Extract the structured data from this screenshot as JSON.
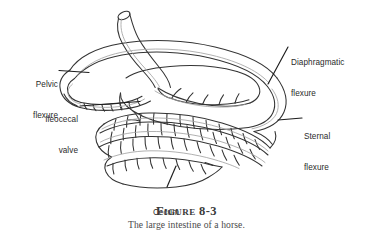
{
  "figure": {
    "number_label": "Figure 8-3",
    "caption": "The large intestine of a horse.",
    "subject": "The large intestine of a horse",
    "background_color": "#ffffff",
    "outline_color": "#333333",
    "shading_color": "#9a9a9a",
    "text_color": "#2b2b2b"
  },
  "labels": {
    "pelvic_flexure": {
      "line1": "Pelvic",
      "line2": "flexure",
      "full": "Pelvic flexure"
    },
    "ileocecal_valve": {
      "line1": "Ileocecal",
      "line2": "valve",
      "full": "Ileocecal valve"
    },
    "diaphragmatic_flexure": {
      "line1": "Diaphragmatic",
      "line2": "flexure",
      "full": "Diaphragmatic flexure"
    },
    "sternal_flexure": {
      "line1": "Sternal",
      "line2": "flexure",
      "full": "Sternal flexure"
    },
    "cecum": {
      "line1": "Cecum",
      "full": "Cecum"
    }
  },
  "anatomy_parts": [
    "pelvic flexure",
    "ileocecal valve",
    "diaphragmatic flexure",
    "sternal flexure",
    "cecum",
    "small colon stump"
  ]
}
